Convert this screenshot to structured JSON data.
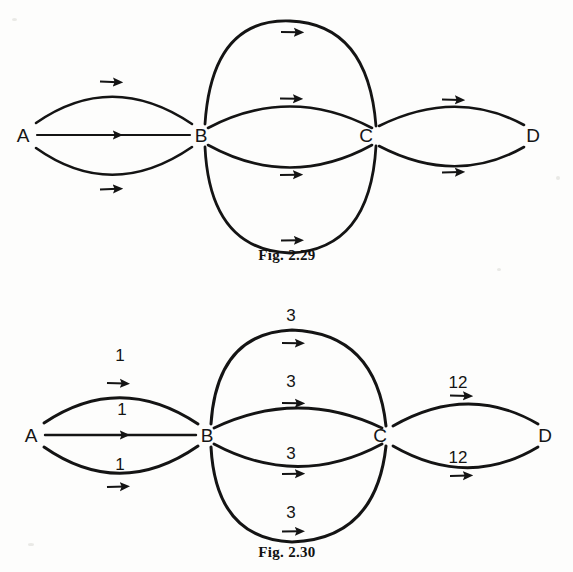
{
  "document": {
    "background_color": "#fdfdfc",
    "ink_color": "#141414",
    "description": "Two textbook multigraph figures showing parallel directed edges between vertices A, B, C, D"
  },
  "figures": [
    {
      "id": "fig-2-29",
      "caption": "Fig. 2.29",
      "caption_x": 287,
      "caption_y": 254,
      "type": "directed-multigraph",
      "weighted": false,
      "nodes": [
        {
          "id": "A",
          "label": "A",
          "x": 23,
          "y": 135
        },
        {
          "id": "B",
          "label": "B",
          "x": 201,
          "y": 135
        },
        {
          "id": "C",
          "label": "C",
          "x": 366,
          "y": 135
        },
        {
          "id": "D",
          "label": "D",
          "x": 533,
          "y": 135
        }
      ],
      "edges": [
        {
          "from": "A",
          "to": "B",
          "curve": "up-large",
          "weight": null
        },
        {
          "from": "A",
          "to": "B",
          "curve": "straight",
          "weight": null
        },
        {
          "from": "A",
          "to": "B",
          "curve": "down-large",
          "weight": null
        },
        {
          "from": "B",
          "to": "C",
          "curve": "up-large",
          "weight": null
        },
        {
          "from": "B",
          "to": "C",
          "curve": "up-small",
          "weight": null
        },
        {
          "from": "B",
          "to": "C",
          "curve": "down-small",
          "weight": null
        },
        {
          "from": "B",
          "to": "C",
          "curve": "down-large",
          "weight": null
        },
        {
          "from": "C",
          "to": "D",
          "curve": "up-medium",
          "weight": null
        },
        {
          "from": "C",
          "to": "D",
          "curve": "down-medium",
          "weight": null
        }
      ]
    },
    {
      "id": "fig-2-30",
      "caption": "Fig. 2.30",
      "caption_x": 287,
      "caption_y": 551,
      "type": "directed-multigraph",
      "weighted": true,
      "nodes": [
        {
          "id": "A",
          "label": "A",
          "x": 31,
          "y": 435
        },
        {
          "id": "B",
          "label": "B",
          "x": 207,
          "y": 435
        },
        {
          "id": "C",
          "label": "C",
          "x": 380,
          "y": 435
        },
        {
          "id": "D",
          "label": "D",
          "x": 545,
          "y": 435
        }
      ],
      "edges": [
        {
          "from": "A",
          "to": "B",
          "curve": "up-large",
          "weight": "1",
          "label_x": 120,
          "label_y": 355
        },
        {
          "from": "A",
          "to": "B",
          "curve": "straight",
          "weight": "1",
          "label_x": 122,
          "label_y": 409
        },
        {
          "from": "A",
          "to": "B",
          "curve": "down-large",
          "weight": "1",
          "label_x": 120,
          "label_y": 464
        },
        {
          "from": "B",
          "to": "C",
          "curve": "up-large",
          "weight": "3",
          "label_x": 291,
          "label_y": 315
        },
        {
          "from": "B",
          "to": "C",
          "curve": "up-small",
          "weight": "3",
          "label_x": 291,
          "label_y": 381
        },
        {
          "from": "B",
          "to": "C",
          "curve": "down-small",
          "weight": "3",
          "label_x": 291,
          "label_y": 453
        },
        {
          "from": "B",
          "to": "C",
          "curve": "down-large",
          "weight": "3",
          "label_x": 291,
          "label_y": 512
        },
        {
          "from": "C",
          "to": "D",
          "curve": "up-medium",
          "weight": "12",
          "label_x": 458,
          "label_y": 382
        },
        {
          "from": "C",
          "to": "D",
          "curve": "down-medium",
          "weight": "12",
          "label_x": 458,
          "label_y": 457
        }
      ]
    }
  ]
}
